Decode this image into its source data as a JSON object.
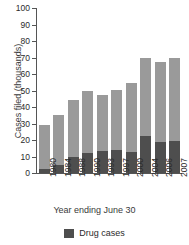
{
  "chart_data": {
    "type": "bar",
    "title": "",
    "xlabel": "Year ending June 30",
    "ylabel": "Cases filed (thousands)",
    "categories": [
      "1980",
      "1984",
      "1988",
      "1990",
      "1993",
      "1997",
      "2000",
      "2004",
      "2006",
      "2007"
    ],
    "ylim": [
      0,
      100
    ],
    "yticks": [
      0,
      10,
      20,
      30,
      40,
      50,
      60,
      70,
      80,
      90,
      100
    ],
    "grid": false,
    "stacked": true,
    "legend_position": "bottom",
    "series": [
      {
        "name": "Drug cases",
        "color": "#4e4e4e",
        "values": [
          2.5,
          5.0,
          10.0,
          12.0,
          13.5,
          14.0,
          13.0,
          22.5,
          18.5,
          19.5
        ]
      },
      {
        "name": "Total cases filed",
        "color": "#9a9a9a",
        "values": [
          29.0,
          35.0,
          44.0,
          49.5,
          47.0,
          50.5,
          54.5,
          70.0,
          67.0,
          69.5
        ]
      }
    ]
  },
  "axes": {
    "y_title": "Cases filed (thousands)",
    "x_title": "Year ending June 30",
    "y_tick_labels": [
      "0",
      "10",
      "20",
      "30",
      "40",
      "50",
      "60",
      "70",
      "80",
      "90",
      "100"
    ],
    "x_tick_labels": [
      "1980",
      "1984",
      "1988",
      "1990",
      "1993",
      "1997",
      "2000",
      "2004",
      "2006",
      "2007"
    ]
  },
  "legend": {
    "items": [
      {
        "label": "Drug cases",
        "color": "#4e4e4e"
      }
    ]
  },
  "colors": {
    "drug_segment": "#4e4e4e",
    "total_segment": "#9a9a9a",
    "axis": "#555555",
    "text": "#2b2b2b",
    "background": "#ffffff"
  }
}
